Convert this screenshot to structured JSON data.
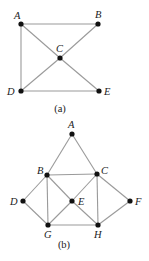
{
  "figures": [
    {
      "caption": "(a)",
      "caption_pos": [
        60,
        112
      ],
      "nodes": [
        {
          "id": "A",
          "x": 21,
          "y": 24,
          "lx": 14,
          "ly": 19
        },
        {
          "id": "B",
          "x": 98,
          "y": 24,
          "lx": 95,
          "ly": 18
        },
        {
          "id": "C",
          "x": 60,
          "y": 58,
          "lx": 56,
          "ly": 52
        },
        {
          "id": "D",
          "x": 21,
          "y": 91,
          "lx": 7,
          "ly": 95
        },
        {
          "id": "E",
          "x": 99,
          "y": 91,
          "lx": 104,
          "ly": 95
        }
      ],
      "edges": [
        [
          "A",
          "B"
        ],
        [
          "A",
          "D"
        ],
        [
          "A",
          "C"
        ],
        [
          "C",
          "E"
        ],
        [
          "B",
          "C"
        ],
        [
          "C",
          "D"
        ],
        [
          "D",
          "E"
        ]
      ]
    },
    {
      "caption": "(b)",
      "caption_pos": [
        64,
        248
      ],
      "nodes": [
        {
          "id": "A",
          "x": 72,
          "y": 134,
          "lx": 68,
          "ly": 128
        },
        {
          "id": "B",
          "x": 47,
          "y": 175,
          "lx": 37,
          "ly": 174
        },
        {
          "id": "C",
          "x": 97,
          "y": 174,
          "lx": 101,
          "ly": 174
        },
        {
          "id": "D",
          "x": 23,
          "y": 201,
          "lx": 10,
          "ly": 205
        },
        {
          "id": "E",
          "x": 72,
          "y": 201,
          "lx": 78,
          "ly": 205
        },
        {
          "id": "F",
          "x": 130,
          "y": 201,
          "lx": 135,
          "ly": 205
        },
        {
          "id": "G",
          "x": 48,
          "y": 225,
          "lx": 44,
          "ly": 238
        },
        {
          "id": "H",
          "x": 98,
          "y": 225,
          "lx": 94,
          "ly": 238
        }
      ],
      "edges": [
        [
          "A",
          "B"
        ],
        [
          "A",
          "C"
        ],
        [
          "B",
          "C"
        ],
        [
          "B",
          "D"
        ],
        [
          "B",
          "E"
        ],
        [
          "B",
          "G"
        ],
        [
          "C",
          "E"
        ],
        [
          "C",
          "H"
        ],
        [
          "C",
          "F"
        ],
        [
          "D",
          "G"
        ],
        [
          "E",
          "G"
        ],
        [
          "E",
          "H"
        ],
        [
          "G",
          "H"
        ],
        [
          "H",
          "F"
        ]
      ]
    }
  ]
}
